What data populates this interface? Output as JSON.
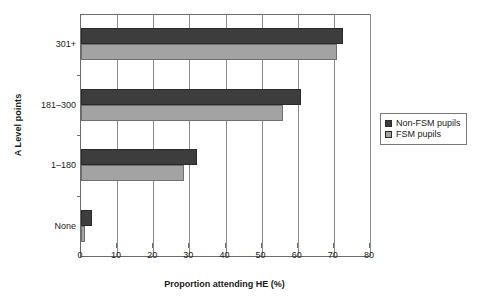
{
  "chart_data": {
    "type": "bar",
    "orientation": "horizontal",
    "title": "",
    "xlabel": "Proportion attending HE (%)",
    "ylabel": "A Level points",
    "categories": [
      "None",
      "1–180",
      "181–300",
      "301+"
    ],
    "series": [
      {
        "name": "Non-FSM pupils",
        "color": "#3d3d3d",
        "values": [
          3,
          32,
          61,
          72.5
        ]
      },
      {
        "name": "FSM pupils",
        "color": "#a3a3a3",
        "values": [
          1,
          28.5,
          56,
          71
        ]
      }
    ],
    "xlim": [
      0,
      80
    ],
    "xticks": [
      0,
      10,
      20,
      30,
      40,
      50,
      60,
      70,
      80
    ],
    "xtick_labels": [
      "0",
      "10",
      "20",
      "30",
      "40",
      "50",
      "60",
      "70",
      "80"
    ],
    "grid": "vertical",
    "legend_position": "right"
  },
  "axes": {
    "y_title": "A Level points",
    "x_title": "Proportion attending HE (%)"
  },
  "legend": {
    "entries": [
      {
        "label": "Non-FSM pupils",
        "swatch": "dark"
      },
      {
        "label": "FSM pupils",
        "swatch": "light"
      }
    ]
  }
}
